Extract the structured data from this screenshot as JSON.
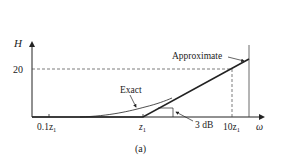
{
  "figure": {
    "caption": "(a)",
    "y_axis_label": "H",
    "x_axis_label": "ω",
    "y_tick_label": "20",
    "x_ticks": [
      {
        "base": "0.1z",
        "sub": "1"
      },
      {
        "base": "z",
        "sub": "1"
      },
      {
        "base": "10z",
        "sub": "1"
      }
    ],
    "annotations": {
      "approximate": "Approximate",
      "exact": "Exact",
      "three_db": "3 dB"
    },
    "colors": {
      "line": "#222222",
      "background": "#ffffff"
    }
  }
}
